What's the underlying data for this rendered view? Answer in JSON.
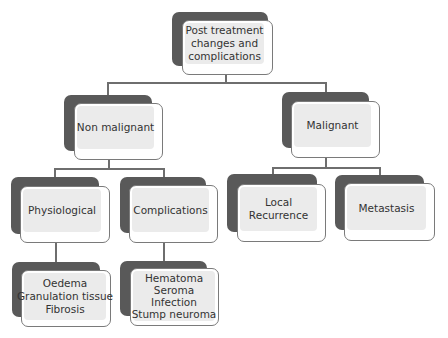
{
  "diagram": {
    "root": {
      "lines": [
        "Post treatment",
        "changes and",
        "complications"
      ]
    },
    "level1": [
      {
        "id": "non-malignant",
        "lines": [
          "Non malignant"
        ]
      },
      {
        "id": "malignant",
        "lines": [
          "Malignant"
        ]
      }
    ],
    "level2": [
      {
        "id": "physiological",
        "parent": "non-malignant",
        "lines": [
          "Physiological"
        ]
      },
      {
        "id": "complications",
        "parent": "non-malignant",
        "lines": [
          "Complications"
        ]
      },
      {
        "id": "local-recurrence",
        "parent": "malignant",
        "lines": [
          "Local",
          "Recurrence"
        ]
      },
      {
        "id": "metastasis",
        "parent": "malignant",
        "lines": [
          "Metastasis"
        ]
      }
    ],
    "level3": [
      {
        "id": "physiological-items",
        "parent": "physiological",
        "lines": [
          "Oedema",
          "Granulation tissue",
          "Fibrosis"
        ]
      },
      {
        "id": "complication-items",
        "parent": "complications",
        "lines": [
          "Hematoma",
          "Seroma",
          "Infection",
          "Stump neuroma"
        ]
      }
    ]
  },
  "colors": {
    "shadow": "#595959",
    "box_fill": "#ebebeb",
    "box_border": "#7a7a7a",
    "connector": "#6e6e6e",
    "text": "#333333"
  }
}
